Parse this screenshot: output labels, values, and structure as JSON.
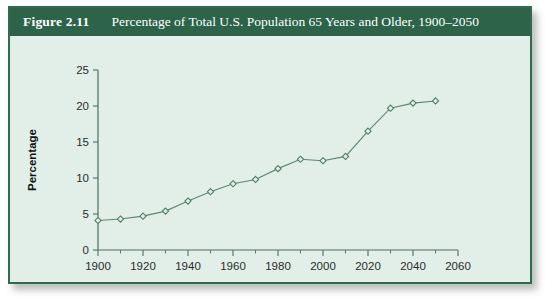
{
  "figure": {
    "number_label": "Figure 2.11",
    "title": "Percentage of Total U.S. Population 65 Years and Older, 1900–2050",
    "border_color": "#2e6b4f",
    "caption_bar_color": "#2c6349",
    "panel_background": "#e2efe8"
  },
  "chart_data": {
    "type": "line",
    "title": "Percentage of Total U.S. Population 65 Years and Older, 1900–2050",
    "xlabel": "",
    "ylabel": "Percentage",
    "xlim": [
      1900,
      2060
    ],
    "ylim": [
      0,
      25
    ],
    "xticks": [
      1900,
      1920,
      1940,
      1960,
      1980,
      2000,
      2020,
      2040,
      2060
    ],
    "xtick_labels": [
      "1900",
      "1920",
      "1940",
      "1960",
      "1980",
      "2000",
      "2020",
      "2040",
      "2060"
    ],
    "xminor_ticks": [
      1910,
      1930,
      1950,
      1970,
      1990,
      2010,
      2030,
      2050
    ],
    "yticks": [
      0,
      5,
      10,
      15,
      20,
      25
    ],
    "ytick_labels": [
      "0",
      "5",
      "10",
      "15",
      "20",
      "25"
    ],
    "grid": false,
    "legend": false,
    "marker": "open-diamond",
    "line_color": "#5d8771",
    "marker_color": "#4f7a63",
    "x": [
      1900,
      1910,
      1920,
      1930,
      1940,
      1950,
      1960,
      1970,
      1980,
      1990,
      2000,
      2010,
      2020,
      2030,
      2040,
      2050
    ],
    "values": [
      4.1,
      4.3,
      4.7,
      5.4,
      6.8,
      8.1,
      9.2,
      9.8,
      11.3,
      12.6,
      12.4,
      13.0,
      16.5,
      19.7,
      20.4,
      20.7
    ],
    "series": [
      {
        "name": "Percentage of total U.S. population 65 years and older",
        "values": [
          4.1,
          4.3,
          4.7,
          5.4,
          6.8,
          8.1,
          9.2,
          9.8,
          11.3,
          12.6,
          12.4,
          13.0,
          16.5,
          19.7,
          20.4,
          20.7
        ]
      }
    ]
  }
}
